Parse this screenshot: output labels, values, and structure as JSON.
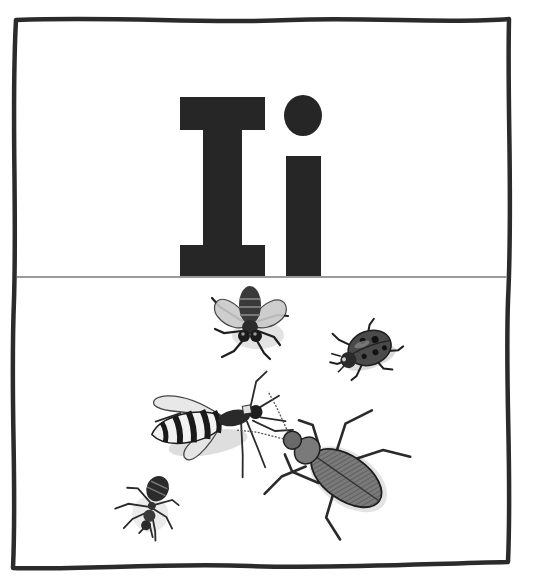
{
  "card": {
    "type": "alphabet-flashcard",
    "letter_upper": "I",
    "letter_lower": "i",
    "letter_display": "Ii",
    "theme": "insects",
    "colors": {
      "frame": "#2b2b2b",
      "divider": "#9a9a9a",
      "letter": "#262626",
      "background": "#ffffff",
      "insect_dark": "#2a2a2a",
      "insect_mid": "#6e6e6e",
      "insect_light": "#bdbdbd",
      "shadow": "#d9d9d9"
    }
  },
  "illustration": {
    "insects": [
      {
        "name": "fly",
        "position": "top-center"
      },
      {
        "name": "ladybug",
        "position": "top-right"
      },
      {
        "name": "wasp",
        "position": "middle-left"
      },
      {
        "name": "ground-beetle",
        "position": "bottom-right"
      },
      {
        "name": "ant",
        "position": "bottom-left"
      }
    ]
  }
}
